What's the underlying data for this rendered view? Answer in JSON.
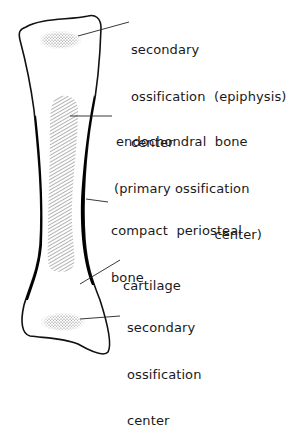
{
  "diagram": {
    "colors": {
      "outline": "#111111",
      "compact_bone": "#000000",
      "stipple": "#555555",
      "hatch": "#666666",
      "background": "#ffffff"
    },
    "labels": {
      "secondary_top": {
        "line1": "secondary",
        "line2": "ossification  (epiphysis)",
        "line3": "center"
      },
      "endochondral": {
        "line1": "endochondral  bone",
        "line2": "(primary ossification",
        "line3": "center)"
      },
      "compact": {
        "line1": "compact  periosteal",
        "line2": "bone"
      },
      "cartilage": {
        "line1": "cartilage"
      },
      "secondary_bottom": {
        "line1": "secondary",
        "line2": "ossification",
        "line3": "center"
      }
    }
  }
}
